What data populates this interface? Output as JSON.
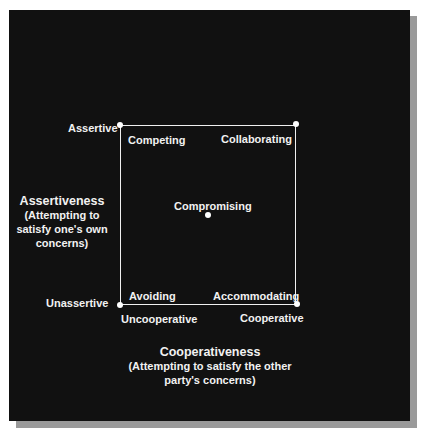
{
  "diagram": {
    "type": "conflict-mode-grid",
    "background_color": "#111111",
    "foreground_color": "#f2f2f2",
    "y_axis": {
      "title": "Assertiveness",
      "subtitle": "(Attempting to satisfy one's own concerns)",
      "subtitle_lines": [
        "(Attempting to",
        "satisfy one's own",
        "concerns)"
      ],
      "high_label": "Assertive",
      "low_label": "Unassertive"
    },
    "x_axis": {
      "title": "Cooperativeness",
      "subtitle_lines": [
        "(Attempting to satisfy the other",
        "party's concerns)"
      ],
      "low_label": "Uncooperative",
      "high_label": "Cooperative"
    },
    "modes": {
      "top_left": "Competing",
      "top_right": "Collaborating",
      "center": "Compromising",
      "bottom_left": "Avoiding",
      "bottom_right": "Accommodating"
    }
  }
}
